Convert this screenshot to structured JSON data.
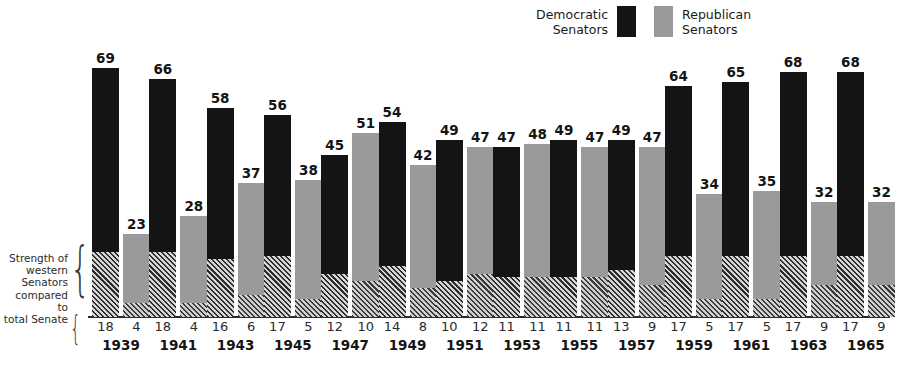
{
  "legend": {
    "democratic": {
      "label": "Democratic\nSenators",
      "color": "#141414",
      "swatch": "dem-swatch"
    },
    "republican": {
      "label": "Republican\nSenators",
      "color": "#9a9a9a",
      "swatch": "rep-swatch"
    }
  },
  "annotation": {
    "text": "Strength of\nwestern\nSenators\ncompared to\ntotal Senate",
    "brace": "{"
  },
  "chart_data": {
    "type": "bar",
    "title": "",
    "xlabel": "",
    "ylabel": "",
    "ylim": [
      0,
      69
    ],
    "grid": false,
    "legend_position": "top-center",
    "categories": [
      "1939",
      "1941",
      "1943",
      "1945",
      "1947",
      "1949",
      "1951",
      "1953",
      "1955",
      "1957",
      "1959",
      "1961",
      "1963",
      "1965"
    ],
    "series": [
      {
        "name": "Democratic Senators",
        "color": "#141414",
        "values": [
          69,
          66,
          58,
          56,
          45,
          54,
          49,
          47,
          49,
          49,
          64,
          65,
          68,
          68
        ]
      },
      {
        "name": "Republican Senators",
        "color": "#9a9a9a",
        "values": [
          23,
          28,
          37,
          38,
          51,
          42,
          47,
          48,
          47,
          47,
          34,
          35,
          32,
          32
        ]
      }
    ],
    "sub_series": [
      {
        "name": "Western Democratic Senators",
        "note": "hatched base portion of Democratic bars",
        "values": [
          18,
          18,
          16,
          17,
          12,
          14,
          10,
          11,
          11,
          13,
          17,
          17,
          17,
          17
        ]
      },
      {
        "name": "Western Republican Senators",
        "note": "hatched base portion of Republican bars",
        "values": [
          4,
          4,
          6,
          5,
          10,
          8,
          12,
          11,
          11,
          9,
          5,
          5,
          9,
          9
        ]
      }
    ]
  }
}
